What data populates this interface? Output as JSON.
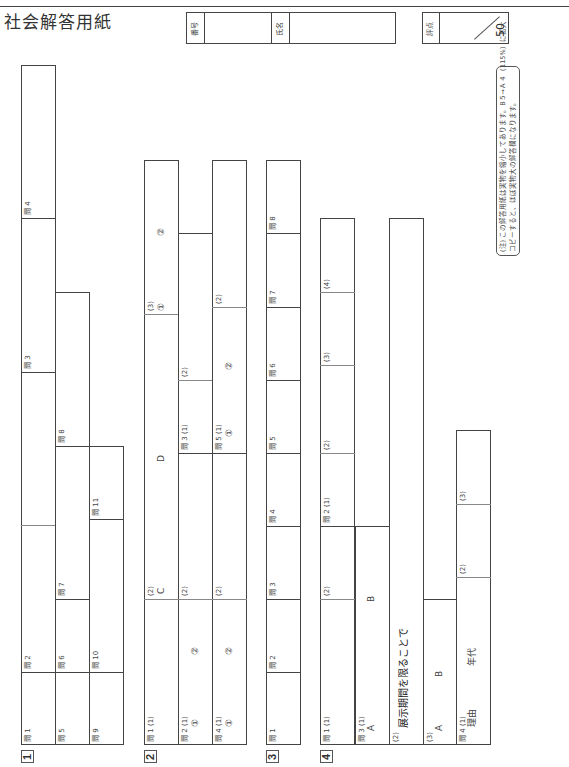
{
  "document": {
    "heading_partial": "…度 … … 入 … 検 …",
    "title": "社会解答用紙"
  },
  "header": {
    "number_label": "番号",
    "name_label": "氏名",
    "score_label": "評点",
    "score_max": "50"
  },
  "note": {
    "line1": "(注) この解答用紙は実物を縮小してあります。B５→Ａ４（115%）に拡大",
    "line2": "コピーすると、ほぼ実物大の解答欄になります。"
  },
  "sections": {
    "s1": {
      "number": "1",
      "q1": "問 1",
      "q2": "問 2",
      "q3": "問 3",
      "q4": "問 4",
      "q5": "問 5",
      "q6": "問 6",
      "q7": "問 7",
      "q8": "問 8",
      "q9": "問 9",
      "q10": "問 10",
      "q11": "問 11"
    },
    "s2": {
      "number": "2",
      "q1_1": "問 1 (1)",
      "q1_2": "(2)",
      "q1_2_c": "C",
      "q1_2_d": "D",
      "q1_3": "(3)",
      "q1_3_a": "①",
      "q1_3_b": "②",
      "q2_1": "問 2 (1)",
      "q2_1_a": "①",
      "q2_1_b": "②",
      "q2_2": "(2)",
      "q3_1": "問 3 (1)",
      "q3_2": "(2)",
      "q4_1": "問 4 (1)",
      "q4_1_a": "①",
      "q4_1_b": "②",
      "q4_2": "(2)",
      "q5_1": "問 5 (1)",
      "q5_1_a": "①",
      "q5_1_b": "②",
      "q5_2": "(2)"
    },
    "s3": {
      "number": "3",
      "q1": "問 1",
      "q2": "問 2",
      "q3": "問 3",
      "q4": "問 4",
      "q5": "問 5",
      "q6": "問 6",
      "q7": "問 7",
      "q8": "問 8"
    },
    "s4": {
      "number": "4",
      "q1_1": "問 1 (1)",
      "q1_2": "(2)",
      "q2_1": "問 2 (1)",
      "q2_2": "(2)",
      "q2_3": "(3)",
      "q2_4": "(4)",
      "q3_1": "問 3 (1)",
      "q3_1_a": "A",
      "q3_1_b": "B",
      "q3_2": "(2)",
      "q3_2_prompt": "展示期間を限ることで",
      "q3_3": "(3)",
      "q3_3_a": "A",
      "q3_3_b": "B",
      "q4_1": "問 4 (1)",
      "q4_1_reason": "理由",
      "q4_1_era": "年代",
      "q4_2": "(2)",
      "q4_3": "(3)"
    }
  }
}
